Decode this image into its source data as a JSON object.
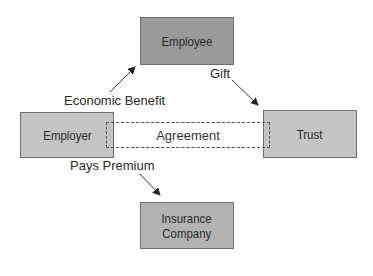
{
  "nodes": {
    "employee": {
      "label": "Employee"
    },
    "employer": {
      "label": "Employer"
    },
    "trust": {
      "label": "Trust"
    },
    "insurance": {
      "label_line1": "Insurance",
      "label_line2": "Company"
    }
  },
  "relation": {
    "label": "Agreement"
  },
  "edges": {
    "economic_benefit": {
      "label": "Economic Benefit"
    },
    "gift": {
      "label": "Gift"
    },
    "pays_premium": {
      "label": "Pays Premium"
    }
  },
  "colors": {
    "employee_fill": "#9a9a9a",
    "box_fill": "#c4c4c4",
    "insurance_fill": "#b3b3b3",
    "stroke": "#6e6e6e"
  }
}
